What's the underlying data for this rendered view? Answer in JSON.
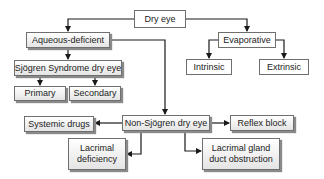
{
  "diagram": {
    "root": {
      "label": "Dry eye"
    },
    "aqueous": {
      "label": "Aqueous-deficient"
    },
    "sjogren": {
      "label": "Sjögren Syndrome dry eye"
    },
    "primary": {
      "label": "Primary"
    },
    "secondary": {
      "label": "Secondary"
    },
    "evaporative": {
      "label": "Evaporative"
    },
    "intrinsic": {
      "label": "Intrinsic"
    },
    "extrinsic": {
      "label": "Extrinsic"
    },
    "non_sjogren": {
      "label": "Non-Sjögren dry eye"
    },
    "systemic_drugs": {
      "label": "Systemic drugs"
    },
    "reflex_block": {
      "label": "Reflex block"
    },
    "lacrimal_deficiency": {
      "label": "Lacrimal deficiency"
    },
    "lacrimal_gland_obstruction": {
      "label": "Lacrimal gland duct obstruction"
    }
  },
  "colors": {
    "line": "#1a1a1a",
    "border": "#6f6f6f",
    "shadow": "#8a8a8a"
  }
}
